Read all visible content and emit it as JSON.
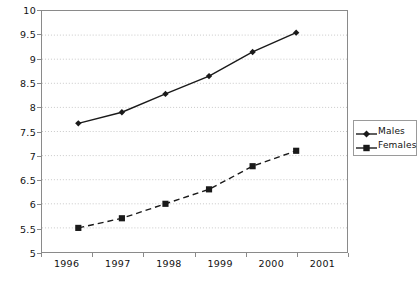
{
  "chart_data": {
    "type": "line",
    "title": "",
    "subtitle": "",
    "xlabel": "",
    "ylabel": "",
    "categories": [
      "1996",
      "1997",
      "1998",
      "1999",
      "2000",
      "2001"
    ],
    "x": [
      1996,
      1997,
      1998,
      1999,
      2000,
      2001
    ],
    "xlim": [
      1995.5,
      2001.5
    ],
    "ylim": [
      5,
      10
    ],
    "ytick_values": [
      5,
      5.5,
      6,
      6.5,
      7,
      7.5,
      8,
      8.5,
      9,
      9.5,
      10
    ],
    "ytick_labels": [
      "5",
      "5.5",
      "6",
      "6.5",
      "7",
      "7.5",
      "8",
      "8.5",
      "9",
      "9.5",
      "10"
    ],
    "grid": "horizontal-dotted",
    "legend_position": "right",
    "series": [
      {
        "name": "Males",
        "values": [
          7.67,
          7.9,
          8.28,
          8.65,
          9.15,
          9.55
        ],
        "marker": "diamond",
        "line_style": "solid",
        "color": "#1a1a1a"
      },
      {
        "name": "Females",
        "values": [
          5.5,
          5.7,
          6.0,
          6.3,
          6.78,
          7.1
        ],
        "marker": "square",
        "line_style": "dashed",
        "color": "#1a1a1a"
      }
    ]
  },
  "legend": {
    "items": [
      {
        "label": "Males",
        "marker": "diamond-marker-icon",
        "line_style": "solid"
      },
      {
        "label": "Females",
        "marker": "square-marker-icon",
        "line_style": "dashed"
      }
    ]
  },
  "axes": {
    "y_labels": [
      "10",
      "9.5",
      "9",
      "8.5",
      "8",
      "7.5",
      "7",
      "6.5",
      "6",
      "5.5",
      "5"
    ],
    "x_labels": [
      "1996",
      "1997",
      "1998",
      "1999",
      "2000",
      "2001"
    ]
  },
  "colors": {
    "series": "#1a1a1a",
    "axis": "#8a8a8a",
    "grid": "#c9c9c9",
    "text": "#111111",
    "background": "#ffffff"
  }
}
